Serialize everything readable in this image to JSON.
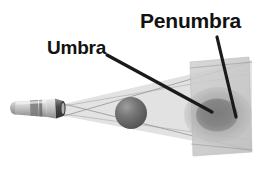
{
  "diagram": {
    "background_color": "#ffffff",
    "labels": [
      {
        "id": "umbra",
        "text": "Umbra",
        "color": "#121212",
        "x": 47,
        "y": 38,
        "font_size": 19,
        "leader_line": {
          "from_x": 107,
          "from_y": 55,
          "to_x": 212,
          "to_y": 112,
          "color": "#1a1a1a",
          "width": 3.2
        }
      },
      {
        "id": "penumbra",
        "text": "Penumbra",
        "color": "#121212",
        "x": 140,
        "y": 10,
        "font_size": 21,
        "leader_line": {
          "from_x": 217,
          "from_y": 37,
          "to_x": 236,
          "to_y": 117,
          "color": "#1a1a1a",
          "width": 3.2
        }
      }
    ],
    "objects": {
      "flashlight": {
        "name": "flashlight",
        "body_color": "#bdbdbd",
        "barrel_color": "#d4d4d4",
        "head_color": "#4a4a4a",
        "tail_color": "#9a9a9a",
        "x": 12,
        "y": 100,
        "length": 52,
        "height": 15
      },
      "sphere": {
        "name": "blocking-sphere",
        "color": "#6b6b6b",
        "highlight_color": "#9c9c9c",
        "center_x": 131,
        "center_y": 113,
        "radius": 16
      },
      "screen": {
        "name": "projection-screen",
        "color": "#c9c9c9",
        "opacity": 0.85,
        "corners": "190,62 249,57 252,152 193,156"
      },
      "umbra_region": {
        "name": "umbra-shadow",
        "color": "#8a8a8a",
        "center_x": 218,
        "center_y": 115,
        "radius_x": 22,
        "radius_y": 17
      },
      "penumbra_region": {
        "name": "penumbra-shadow",
        "color": "#a8a8a8",
        "center_x": 218,
        "center_y": 115,
        "radius_x": 34,
        "radius_y": 28
      },
      "light_cone": {
        "name": "light-cone",
        "color": "#d8d8d8",
        "edge_color": "#8d8d8d",
        "source_x": 64,
        "source_y": 110,
        "spread_top": 78,
        "spread_bottom": 150
      }
    }
  }
}
